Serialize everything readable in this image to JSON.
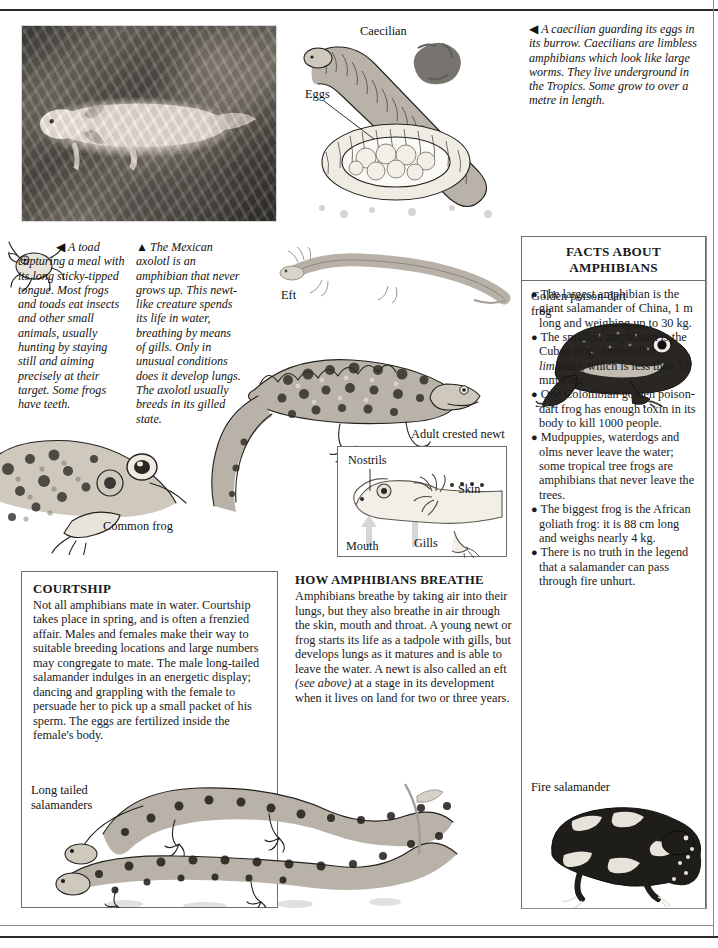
{
  "page": {
    "title": "Amphibians",
    "background_hex": "#ffffff",
    "rule_color_hex": "#2b2b2b"
  },
  "photo": {
    "name": "axolotl-photograph",
    "subject": "Mexican axolotl in an aquarium with plants"
  },
  "captions": {
    "caecilian": {
      "arrow": "◀",
      "text": "A caecilian guarding its eggs in its burrow. Caecilians are limbless amphibians which look like large worms. They live underground in the Tropics. Some grow to over a metre in length."
    },
    "toad": {
      "arrow": "◀",
      "text": "A toad capturing a meal with its long sticky-tipped tongue. Most frogs and toads eat insects and other small animals, usually hunting by staying still and aiming precisely at their target. Some frogs have teeth."
    },
    "axolotl": {
      "arrow": "▲",
      "text": "The Mexican axolotl is an amphibian that never grows up. This newt-like creature spends its life in water, breathing by means of gills. Only in unusual conditions does it develop lungs. The axolotl usually breeds in its gilled state."
    }
  },
  "labels": {
    "caecilian": "Caecilian",
    "eggs": "Eggs",
    "eft": "Eft",
    "adult_crested_newt": "Adult crested newt",
    "common_frog": "Common frog",
    "long_tailed_salamanders": "Long tailed\nsalamanders",
    "fire_salamander": "Fire salamander",
    "golden_poison_dart_frog": "Golden poison-dart\nfrog"
  },
  "anatomy": {
    "nostrils": "Nostrils",
    "skin": "Skin",
    "gills": "Gills",
    "mouth": "Mouth"
  },
  "facts_panel": {
    "title": "FACTS ABOUT\nAMPHIBIANS",
    "items": [
      "The largest amphibian is the giant salamander of China, 1 m long and weighing up to 30 kg.",
      "The smallest amphibian is the Cuban frog, Sminthillus limbatus, which is less than 12 mm long.",
      "One Colombian golden poison-dart frog has enough toxin in its body to kill 1000 people.",
      "Mudpuppies, waterdogs and olms never leave the water; some tropical tree frogs are amphibians that never leave the trees.",
      "The biggest frog is the African goliath frog: it is 88 cm long and weighs nearly 4 kg.",
      "There is no truth in the legend that a salamander can pass through fire unhurt."
    ],
    "italic_phrase": "Sminthillus limbatus"
  },
  "courtship": {
    "title": "COURTSHIP",
    "text": "Not all amphibians mate in water. Courtship takes place in spring, and is often a frenzied affair. Males and females make their way to suitable breeding locations and large numbers may congregate to mate. The male long-tailed salamander indulges in an energetic display; dancing and grappling with the female to persuade her to pick up a small packet of his sperm. The eggs are fertilized inside the female's body."
  },
  "breathe": {
    "title": "HOW AMPHIBIANS BREATHE",
    "text_part1": "Amphibians breathe by taking air into their lungs, but they also breathe in air through the skin, mouth and throat. A young newt or frog starts its life as a tadpole with gills, but develops lungs as it matures and is able to leave the water. A newt is also called an eft ",
    "italic_aside": "(see above)",
    "text_part2": " at a stage in its development when it lives on land for two or three years."
  }
}
